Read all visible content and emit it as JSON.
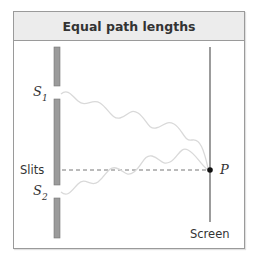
{
  "title": "Equal path lengths",
  "labels": {
    "s1_letter": "S",
    "s1_sub": "1",
    "s2_letter": "S",
    "s2_sub": "2",
    "slits": "Slits",
    "point": "P",
    "screen": "Screen"
  },
  "colors": {
    "frame_border": "#9a9a9a",
    "header_bg": "#ececec",
    "barrier": "#9b9b9b",
    "barrier_edge": "#777777",
    "screen_line": "#666666",
    "wave": "#d9d9d9",
    "dashed_line": "#666666",
    "point": "#111111",
    "text": "#333333"
  }
}
